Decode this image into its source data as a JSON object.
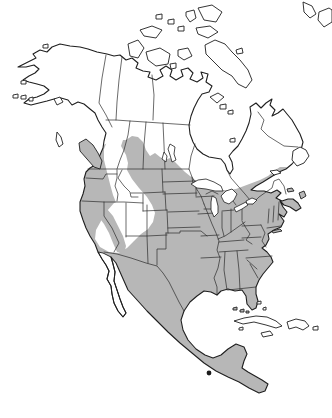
{
  "meta": {
    "figure_kind": "species range map",
    "area_shown": "North America (Alaska and Canada to Honduras/Nicaragua, with Caribbean islands)",
    "visible_text": "none"
  },
  "colors": {
    "background": "#ffffff",
    "land_unshaded": "#ffffff",
    "range_shaded": "#b7b7b7",
    "outline": "#1f1f1f",
    "border_line": "#2b2b2b",
    "water": "#ffffff",
    "dark_spot": "#1c1c1c"
  },
  "map": {
    "shaded_regions": [
      {
        "name": "contiguous-united-states",
        "shaded": true
      },
      {
        "name": "mexico-mainland",
        "shaded": true
      },
      {
        "name": "central-america",
        "shaded": true
      },
      {
        "name": "southern-british-columbia-coast",
        "shaded": true
      },
      {
        "name": "vancouver-island",
        "shaded": true
      },
      {
        "name": "southern-prairie-provinces",
        "shaded": true
      },
      {
        "name": "southern-ontario-quebec-st-lawrence",
        "shaded": true
      },
      {
        "name": "maritime-provinces",
        "shaded": true
      }
    ],
    "unshaded_regions": [
      {
        "name": "alaska",
        "shaded": false
      },
      {
        "name": "yukon-and-northern-canada",
        "shaded": false
      },
      {
        "name": "arctic-archipelago",
        "shaded": false
      },
      {
        "name": "quebec-labrador-north",
        "shaded": false
      },
      {
        "name": "newfoundland",
        "shaded": false
      },
      {
        "name": "great-basin-and-northern-rockies-corridor",
        "shaded": false
      },
      {
        "name": "baja-california-peninsula",
        "shaded": false
      },
      {
        "name": "cuba",
        "shaded": false
      },
      {
        "name": "hispaniola",
        "shaded": false
      },
      {
        "name": "jamaica",
        "shaded": false
      },
      {
        "name": "puerto-rico",
        "shaded": false
      }
    ],
    "water_bodies": [
      "hudson-bay",
      "james-bay",
      "gulf-of-st-lawrence",
      "gulf-of-mexico",
      "gulf-of-california",
      "lake-superior",
      "lake-michigan",
      "lake-huron",
      "lake-erie",
      "lake-ontario",
      "lake-winnipeg",
      "lake-manitoba"
    ]
  }
}
